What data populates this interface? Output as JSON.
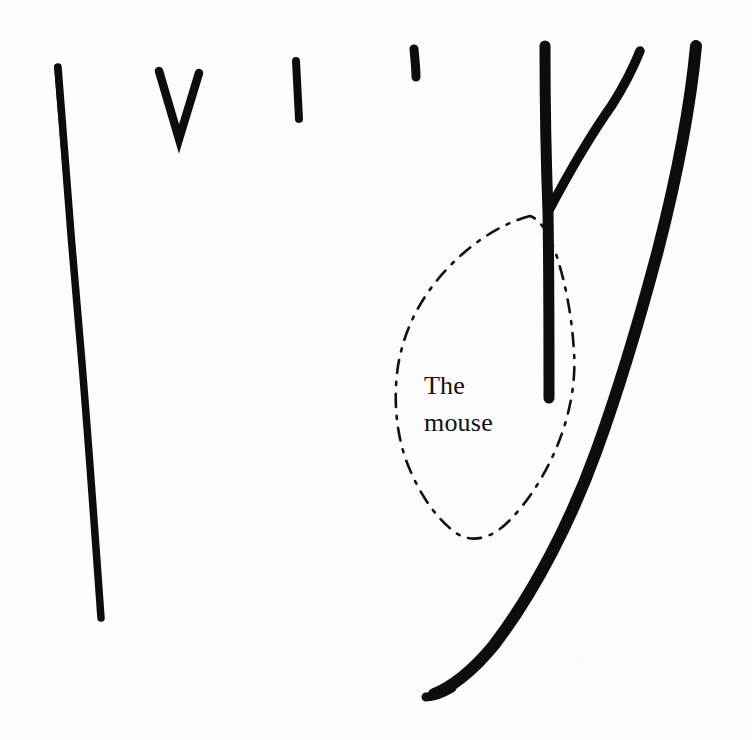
{
  "document": {
    "kind": "scanned-hand-drawn-sketch",
    "width": 752,
    "height": 740,
    "background_color": "#fefefe",
    "ink_color": "#0d0d0d"
  },
  "annotations": [
    {
      "id": "the",
      "text": "The",
      "x": 424,
      "y": 371
    },
    {
      "id": "mouse",
      "text": "mouse",
      "x": 424,
      "y": 408
    }
  ],
  "label": {
    "line1": "The",
    "line2": "mouse",
    "full_text": "The mouse"
  },
  "strokes": [
    {
      "name": "left-long-vertical-stroke",
      "style": "solid-ink",
      "description": "long slightly curving near-vertical line on the left side",
      "start": [
        57,
        66
      ],
      "end": [
        103,
        620
      ]
    },
    {
      "name": "v-mark",
      "style": "solid-ink",
      "description": "short V shaped chevron mark near the top left-of-centre",
      "start": [
        158,
        70
      ],
      "end": [
        200,
        72
      ]
    },
    {
      "name": "short-tick-mark",
      "style": "solid-ink",
      "description": "small upright tick / stem mark",
      "start": [
        296,
        60
      ],
      "end": [
        299,
        120
      ]
    },
    {
      "name": "apostrophe-mark",
      "style": "solid-ink",
      "description": "tiny comma / apostrophe shaped mark",
      "start": [
        413,
        48
      ],
      "end": [
        417,
        78
      ]
    },
    {
      "name": "branching-y-stroke",
      "style": "solid-ink-thick",
      "description": "thick vertical stroke with an upward-right branch forming a Y fork",
      "start": [
        544,
        45
      ],
      "end": [
        549,
        400
      ],
      "branch_start": [
        548,
        210
      ],
      "branch_end": [
        640,
        50
      ]
    },
    {
      "name": "long-sweeping-curve",
      "style": "solid-ink-thick",
      "description": "long thick curve descending from top right, bowing right then sweeping down-left to a hooked foot",
      "start": [
        696,
        45
      ],
      "end": [
        428,
        695
      ]
    },
    {
      "name": "dashed-teardrop-outline",
      "style": "dashed-ink",
      "description": "dash-dot teardrop / leaf shaped closed outline enclosing the label",
      "bounds": [
        396,
        212,
        575,
        540
      ]
    }
  ],
  "colors": {
    "ink": "#0d0d0d",
    "paper": "#fefefe",
    "dashed_ink": "#111111"
  }
}
